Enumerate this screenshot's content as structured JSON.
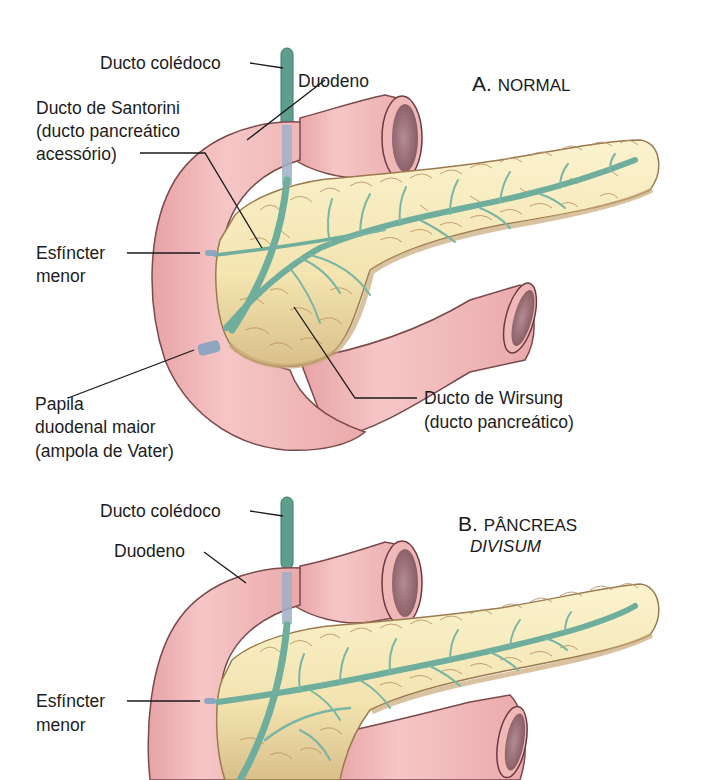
{
  "colors": {
    "duodenum_fill": "#eeb3b4",
    "duodenum_stroke": "#7a4a4c",
    "lumen": "#9c6e78",
    "pancreas_fill": "#f6ebbd",
    "pancreas_shadow": "#d8bf8c",
    "lobule_stroke": "#9a7a4e",
    "duct": "#6fae9c",
    "duct_dark": "#3d7a6c",
    "papilla": "#8fa6c0",
    "leader": "#1a1a1a"
  },
  "panel_a": {
    "title_letter": "A.",
    "title_text": "NORMAL",
    "labels": {
      "common_bile_duct": "Ducto colédoco",
      "duodenum": "Duodeno",
      "santorini_line1": "Ducto de Santorini",
      "santorini_line2": "(ducto pancreático",
      "santorini_line3": "acessório)",
      "minor_sphincter_line1": "Esfíncter",
      "minor_sphincter_line2": "menor",
      "major_papilla_line1": "Papila",
      "major_papilla_line2": "duodenal maior",
      "major_papilla_line3": "(ampola de Vater)",
      "wirsung_line1": "Ducto de Wirsung",
      "wirsung_line2": "(ducto pancreático)"
    }
  },
  "panel_b": {
    "title_letter": "B.",
    "title_text": "PÂNCREAS",
    "title_italic": "DIVISUM",
    "labels": {
      "common_bile_duct": "Ducto colédoco",
      "duodenum": "Duodeno",
      "minor_sphincter_line1": "Esfíncter",
      "minor_sphincter_line2": "menor"
    }
  }
}
